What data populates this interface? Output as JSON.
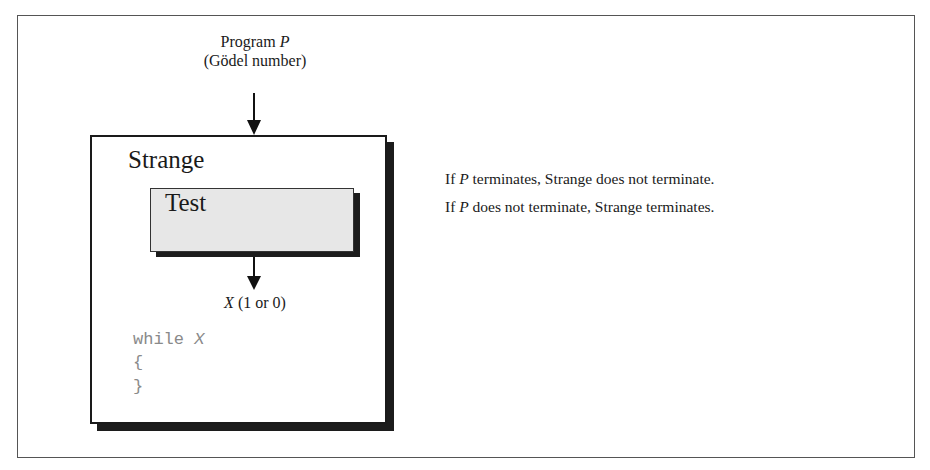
{
  "diagram": {
    "input": {
      "line1_prefix": "Program ",
      "line1_var": "P",
      "line2": "(Gödel number)"
    },
    "outer_box": {
      "title": "Strange"
    },
    "inner_box": {
      "title": "Test",
      "fill_color": "#e7e7e7"
    },
    "output": {
      "var": "X",
      "suffix": " (1 or 0)"
    },
    "code": {
      "line1_keyword": "while ",
      "line1_var": "X",
      "line2": "{",
      "line3": "}",
      "color": "#8a8a8a"
    },
    "explanation": [
      {
        "prefix": "If ",
        "var": "P",
        "suffix": " terminates, Strange does not terminate."
      },
      {
        "prefix": "If ",
        "var": "P",
        "suffix": " does not terminate, Strange terminates."
      }
    ]
  }
}
